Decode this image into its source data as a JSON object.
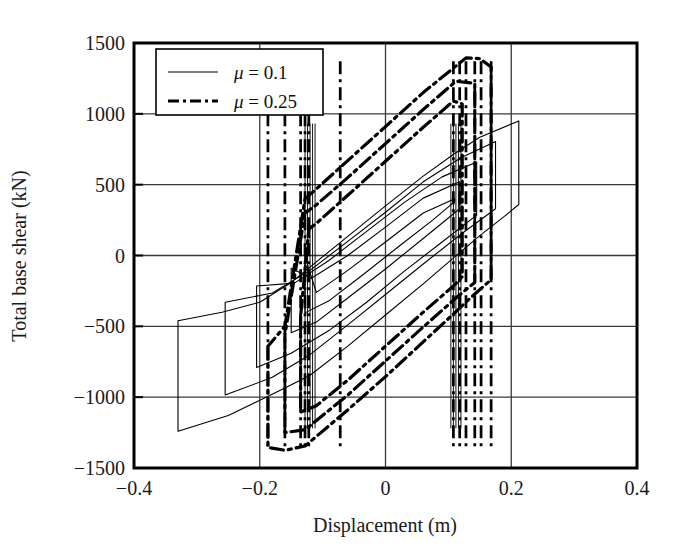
{
  "figure": {
    "kind": "hysteresis-plot",
    "background": "#ffffff",
    "ink": "#000000",
    "grid_color": "#3a3a3a"
  },
  "chart_data": {
    "type": "line",
    "title": "",
    "subtitle": "",
    "xlabel": "Displacement (m)",
    "ylabel": "Total base shear (kN)",
    "xlim": [
      -0.4,
      0.4
    ],
    "ylim": [
      -1500,
      1500
    ],
    "xticks": [
      -0.4,
      -0.2,
      0,
      0.2,
      0.4
    ],
    "xtick_labels": [
      "−0.4",
      "−0.2",
      "0",
      "0.2",
      "0.4"
    ],
    "yticks": [
      -1500,
      -1000,
      -500,
      0,
      500,
      1000,
      1500
    ],
    "ytick_labels": [
      "−1500",
      "−1000",
      "−500",
      "0",
      "500",
      "1000",
      "1500"
    ],
    "grid": true,
    "grid_axes": "both",
    "legend_position": "top-left",
    "legend": [
      {
        "label": "μ = 0.1",
        "mu": "μ",
        "value": "= 0.1",
        "style": "solid",
        "width": 1.1
      },
      {
        "label": "μ = 0.25",
        "mu": "μ",
        "value": "= 0.25",
        "style": "dashdot",
        "width": 3.2
      }
    ],
    "series": [
      {
        "name": "μ = 0.1",
        "style": "solid",
        "linewidth": 1.1,
        "color": "#000000",
        "description": "Thin solid hysteresis loops, low friction coefficient; wide flat parallelogram loops with long sliding plateaus.",
        "x_range": [
          -0.33,
          0.212
        ],
        "y_range": [
          -1245,
          950
        ],
        "post_slip_stiffness_kN_per_m": 3400,
        "loops": [
          {
            "name": "outer-loop",
            "points": [
              [
                -0.33,
                -460
              ],
              [
                -0.33,
                -1240
              ],
              [
                -0.25,
                -1130
              ],
              [
                -0.16,
                -935
              ],
              [
                -0.12,
                -845
              ],
              [
                -0.06,
                -640
              ],
              [
                0.0,
                -420
              ],
              [
                0.06,
                -200
              ],
              [
                0.11,
                -10
              ],
              [
                0.15,
                140
              ],
              [
                0.19,
                280
              ],
              [
                0.212,
                360
              ],
              [
                0.212,
                950
              ],
              [
                0.15,
                835
              ],
              [
                0.11,
                720
              ],
              [
                0.06,
                560
              ],
              [
                0.0,
                350
              ],
              [
                -0.06,
                135
              ],
              [
                -0.11,
                -45
              ],
              [
                -0.15,
                -190
              ],
              [
                -0.2,
                -330
              ],
              [
                -0.26,
                -400
              ],
              [
                -0.33,
                -460
              ]
            ]
          },
          {
            "name": "mid-loop-a",
            "points": [
              [
                -0.255,
                -330
              ],
              [
                -0.255,
                -985
              ],
              [
                -0.18,
                -860
              ],
              [
                -0.12,
                -700
              ],
              [
                -0.06,
                -490
              ],
              [
                0.0,
                -275
              ],
              [
                0.06,
                -60
              ],
              [
                0.12,
                150
              ],
              [
                0.175,
                330
              ],
              [
                0.175,
                805
              ],
              [
                0.12,
                690
              ],
              [
                0.06,
                520
              ],
              [
                0.0,
                305
              ],
              [
                -0.06,
                100
              ],
              [
                -0.12,
                -105
              ],
              [
                -0.18,
                -265
              ],
              [
                -0.255,
                -330
              ]
            ]
          },
          {
            "name": "mid-loop-b",
            "points": [
              [
                -0.205,
                -215
              ],
              [
                -0.205,
                -790
              ],
              [
                -0.15,
                -690
              ],
              [
                -0.09,
                -530
              ],
              [
                -0.03,
                -330
              ],
              [
                0.03,
                -110
              ],
              [
                0.09,
                95
              ],
              [
                0.145,
                285
              ],
              [
                0.145,
                660
              ],
              [
                0.09,
                555
              ],
              [
                0.03,
                375
              ],
              [
                -0.03,
                170
              ],
              [
                -0.09,
                -35
              ],
              [
                -0.145,
                -195
              ],
              [
                -0.205,
                -215
              ]
            ]
          },
          {
            "name": "inner-loop-a",
            "points": [
              [
                -0.15,
                -90
              ],
              [
                -0.15,
                -545
              ],
              [
                -0.11,
                -470
              ],
              [
                -0.06,
                -300
              ],
              [
                0.0,
                -95
              ],
              [
                0.06,
                120
              ],
              [
                0.118,
                330
              ],
              [
                0.118,
                520
              ],
              [
                0.06,
                405
              ],
              [
                0.0,
                200
              ],
              [
                -0.06,
                0
              ],
              [
                -0.118,
                -160
              ],
              [
                -0.15,
                -90
              ]
            ]
          },
          {
            "name": "inner-loop-b",
            "points": [
              [
                -0.128,
                -10
              ],
              [
                -0.128,
                -405
              ],
              [
                -0.09,
                -320
              ],
              [
                -0.04,
                -150
              ],
              [
                0.02,
                60
              ],
              [
                0.075,
                250
              ],
              [
                0.11,
                380
              ],
              [
                0.11,
                400
              ],
              [
                0.06,
                300
              ],
              [
                0.0,
                95
              ],
              [
                -0.06,
                -105
              ],
              [
                -0.11,
                -260
              ],
              [
                -0.128,
                -10
              ]
            ]
          },
          {
            "name": "slip-lines-left-cluster-x",
            "vertical_x": [
              -0.128,
              -0.124,
              -0.12,
              -0.116,
              -0.112
            ]
          },
          {
            "name": "slip-lines-right-cluster-x",
            "vertical_x": [
              0.104,
              0.108,
              0.112,
              0.116,
              0.12
            ]
          }
        ]
      },
      {
        "name": "μ = 0.25",
        "style": "dashdot",
        "linewidth": 3.2,
        "color": "#000000",
        "description": "Bold dash-dot hysteresis loops, higher friction coefficient; narrower and taller loops with larger force capacity.",
        "x_range": [
          -0.187,
          0.168
        ],
        "y_range": [
          -1380,
          1400
        ],
        "post_slip_stiffness_kN_per_m": 3700,
        "loops": [
          {
            "name": "outer-loop",
            "points": [
              [
                -0.187,
                -640
              ],
              [
                -0.187,
                -1355
              ],
              [
                -0.16,
                -1375
              ],
              [
                -0.128,
                -1345
              ],
              [
                -0.06,
                -1090
              ],
              [
                0.0,
                -855
              ],
              [
                0.06,
                -610
              ],
              [
                0.11,
                -405
              ],
              [
                0.13,
                -320
              ],
              [
                0.168,
                -170
              ],
              [
                0.168,
                1330
              ],
              [
                0.15,
                1390
              ],
              [
                0.128,
                1395
              ],
              [
                0.06,
                1150
              ],
              [
                0.0,
                910
              ],
              [
                -0.06,
                670
              ],
              [
                -0.11,
                470
              ],
              [
                -0.128,
                400
              ],
              [
                -0.16,
                -500
              ],
              [
                -0.187,
                -640
              ]
            ]
          },
          {
            "name": "mid-loop",
            "points": [
              [
                -0.16,
                -560
              ],
              [
                -0.16,
                -1250
              ],
              [
                -0.128,
                -1230
              ],
              [
                -0.06,
                -985
              ],
              [
                0.0,
                -745
              ],
              [
                0.06,
                -505
              ],
              [
                0.112,
                -300
              ],
              [
                0.142,
                -190
              ],
              [
                0.142,
                1215
              ],
              [
                0.112,
                1230
              ],
              [
                0.06,
                1030
              ],
              [
                0.0,
                790
              ],
              [
                -0.06,
                550
              ],
              [
                -0.112,
                350
              ],
              [
                -0.128,
                300
              ],
              [
                -0.16,
                -560
              ]
            ]
          },
          {
            "name": "inner-loop",
            "points": [
              [
                -0.135,
                -430
              ],
              [
                -0.135,
                -1105
              ],
              [
                -0.11,
                -1060
              ],
              [
                -0.06,
                -880
              ],
              [
                0.0,
                -640
              ],
              [
                0.06,
                -400
              ],
              [
                0.108,
                -215
              ],
              [
                0.122,
                -150
              ],
              [
                0.122,
                1070
              ],
              [
                0.108,
                1090
              ],
              [
                0.06,
                905
              ],
              [
                0.0,
                665
              ],
              [
                -0.06,
                425
              ],
              [
                -0.108,
                235
              ],
              [
                -0.122,
                185
              ],
              [
                -0.135,
                -430
              ]
            ]
          },
          {
            "name": "slip-lines-left-cluster-x",
            "vertical_x": [
              -0.187,
              -0.16,
              -0.135,
              -0.128,
              -0.122,
              -0.072
            ]
          },
          {
            "name": "slip-lines-right-cluster-x",
            "vertical_x": [
              0.108,
              0.118,
              0.128,
              0.142,
              0.152,
              0.168
            ]
          }
        ]
      }
    ]
  }
}
